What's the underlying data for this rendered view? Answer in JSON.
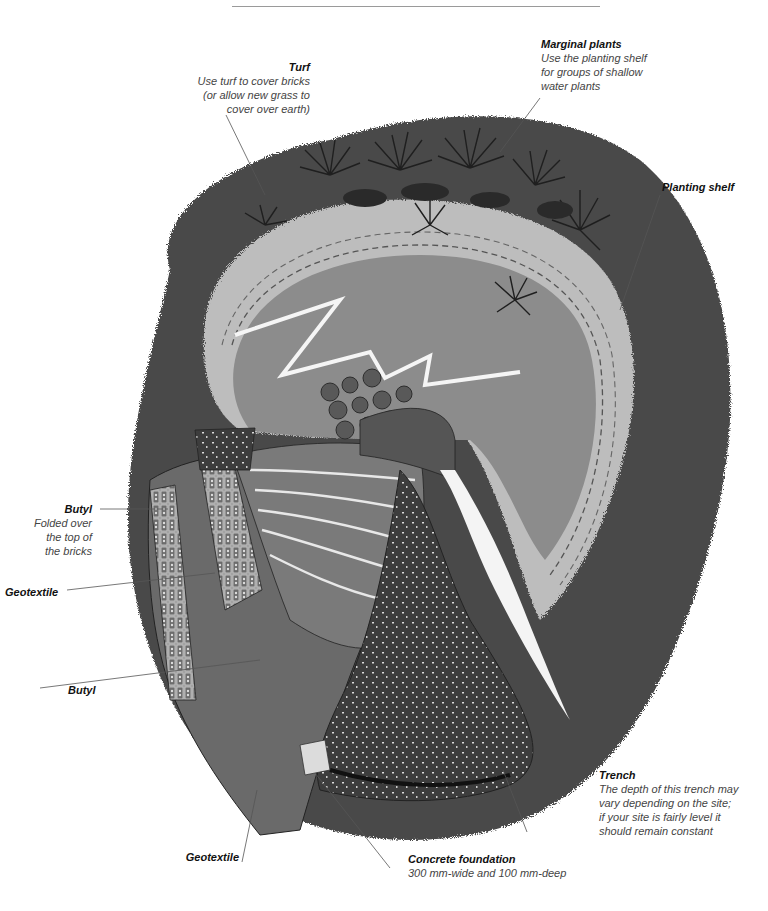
{
  "figure": {
    "style": "monochrome watercolour"
  },
  "labels": {
    "turf": {
      "title": "Turf",
      "desc": [
        "Use turf to cover bricks",
        "(or allow new grass to",
        "cover over earth)"
      ]
    },
    "marginal_plants": {
      "title": "Marginal plants",
      "desc": [
        "Use the planting shelf",
        "for groups of shallow",
        "water plants"
      ]
    },
    "planting_shelf": {
      "title": "Planting shelf"
    },
    "butyl_top": {
      "title": "Butyl",
      "desc": [
        "Folded over",
        "the top of",
        "the bricks"
      ]
    },
    "geotextile_left": {
      "title": "Geotextile"
    },
    "butyl_lower": {
      "title": "Butyl"
    },
    "trench": {
      "title": "Trench",
      "desc": [
        "The depth of this trench may",
        "vary depending on the site;",
        "if your site is fairly level it",
        "should remain constant"
      ]
    },
    "geotextile_bottom": {
      "title": "Geotextile"
    },
    "concrete_foundation": {
      "title": "Concrete foundation",
      "desc": [
        "300 mm-wide and 100 mm-deep"
      ]
    }
  },
  "colors": {
    "earth_dark": "#3c3c3c",
    "earth_mid": "#5a5a5a",
    "water": "#8e8e8e",
    "shelf": "#b5b5b5",
    "leader": "#555555"
  }
}
